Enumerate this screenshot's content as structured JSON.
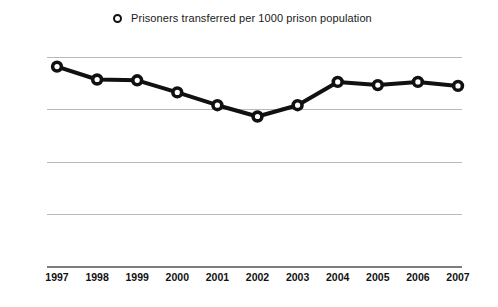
{
  "legend": {
    "position": "top-center",
    "marker_icon": "ring-marker-icon",
    "entries": [
      {
        "label": "Prisoners transferred per 1000 prison population",
        "color": "#111111"
      }
    ]
  },
  "axes": {
    "y_ticks": [
      "13",
      "9.75",
      "6.5",
      "3.25",
      "0"
    ],
    "x_ticks": [
      "1997",
      "1998",
      "1999",
      "2000",
      "2001",
      "2002",
      "2003",
      "2004",
      "2005",
      "2006",
      "2007"
    ]
  },
  "chart_data": {
    "type": "line",
    "title": "",
    "subtitle": "",
    "xlabel": "",
    "ylabel": "",
    "categories": [
      "1997",
      "1998",
      "1999",
      "2000",
      "2001",
      "2002",
      "2003",
      "2004",
      "2005",
      "2006",
      "2007"
    ],
    "series": [
      {
        "name": "Prisoners transferred per 1000 prison population",
        "color": "#111111",
        "marker": "open-circle",
        "values": [
          12.4,
          11.6,
          11.55,
          10.8,
          10.0,
          9.3,
          10.0,
          11.45,
          11.25,
          11.45,
          11.2
        ]
      }
    ],
    "ylim": [
      0,
      13
    ],
    "yticks": [
      0,
      3.25,
      6.5,
      9.75,
      13
    ],
    "ytick_labels": [
      "0",
      "3.25",
      "6.5",
      "9.75",
      "13"
    ],
    "grid": true,
    "grid_axis": "y",
    "legend_position": "top-center"
  }
}
